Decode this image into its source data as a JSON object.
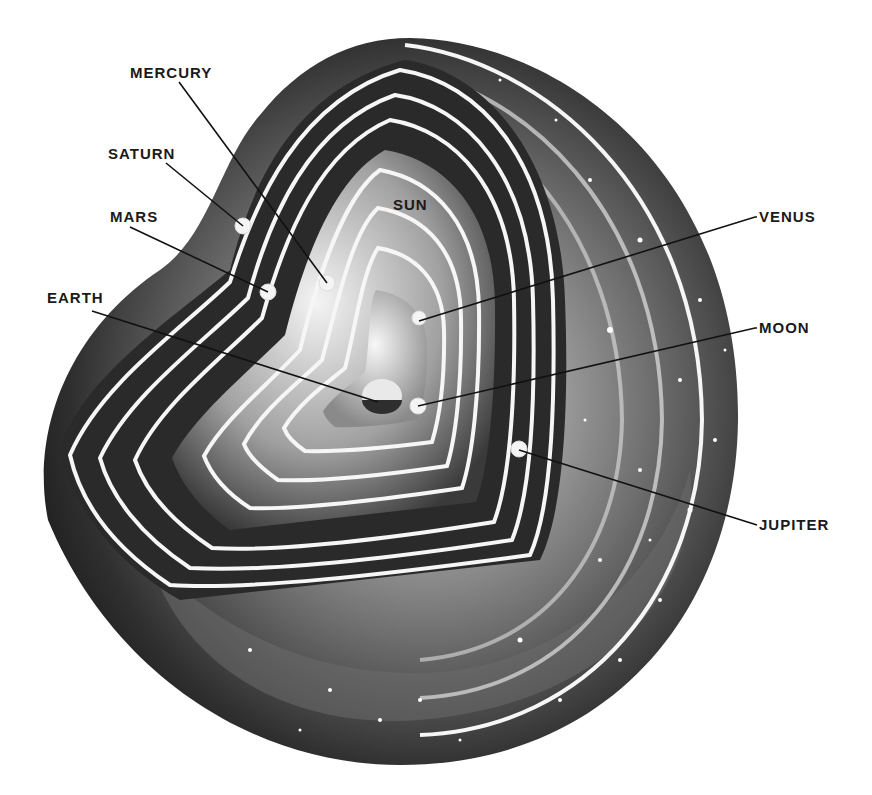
{
  "diagram": {
    "title": "",
    "colors": {
      "background": "#ffffff",
      "ink": "#1a1a1a",
      "sphere_dark": "#2a2a2a",
      "sphere_light": "#e8e8e8",
      "orbit_line": "#f6f6f6"
    },
    "labels": [
      {
        "id": "mercury",
        "text": "MERCURY",
        "x": 130,
        "y": 78,
        "target": [
          327,
          283
        ]
      },
      {
        "id": "saturn",
        "text": "SATURN",
        "x": 108,
        "y": 159,
        "target": [
          243,
          226
        ]
      },
      {
        "id": "mars",
        "text": "MARS",
        "x": 110,
        "y": 222,
        "target": [
          268,
          292
        ]
      },
      {
        "id": "sun",
        "text": "SUN",
        "x": 393,
        "y": 210,
        "target": null
      },
      {
        "id": "venus",
        "text": "VENUS",
        "x": 759,
        "y": 222,
        "target": [
          419,
          321
        ]
      },
      {
        "id": "earth",
        "text": "EARTH",
        "x": 47,
        "y": 303,
        "target": [
          378,
          402
        ]
      },
      {
        "id": "moon",
        "text": "MOON",
        "x": 759,
        "y": 333,
        "target": [
          418,
          406
        ]
      },
      {
        "id": "jupiter",
        "text": "JUPITER",
        "x": 759,
        "y": 530,
        "target": [
          519,
          450
        ]
      }
    ]
  }
}
